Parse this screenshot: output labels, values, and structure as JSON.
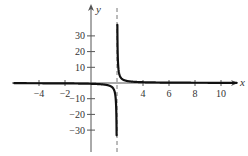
{
  "chart_data": {
    "type": "line",
    "title": "",
    "xlabel": "x",
    "ylabel": "y",
    "xlim": [
      -5.9,
      11.2
    ],
    "ylim": [
      -42,
      48
    ],
    "grid": false,
    "x_ticks": [
      -4,
      -2,
      4,
      6,
      8,
      10
    ],
    "y_ticks": [
      30,
      20,
      10,
      -10,
      -20,
      -30
    ],
    "vertical_asymptote": 2,
    "horizontal_asymptote": 0,
    "function": "y = 1/(x - 2)",
    "series": [
      {
        "name": "left-branch",
        "x": [
          -5.9,
          -4,
          -2,
          0,
          1,
          1.5,
          1.8,
          1.9,
          1.95,
          1.97
        ],
        "values": [
          -0.13,
          -0.17,
          -0.25,
          -0.5,
          -1,
          -2,
          -5,
          -10,
          -20,
          -33
        ]
      },
      {
        "name": "right-branch",
        "x": [
          2.027,
          2.05,
          2.1,
          2.2,
          2.5,
          3,
          4,
          6,
          8,
          10,
          11.2
        ],
        "values": [
          37,
          20,
          10,
          5,
          2,
          1,
          0.5,
          0.25,
          0.17,
          0.125,
          0.11
        ]
      }
    ]
  },
  "colors": {
    "curve": "#111111",
    "axis": "#555555",
    "asymptote": "#777777",
    "text": "#333333"
  }
}
